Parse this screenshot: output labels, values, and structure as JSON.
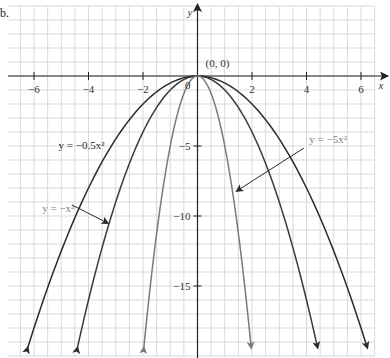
{
  "figure": {
    "part_label": "b."
  },
  "chart_data": {
    "type": "line",
    "title": "",
    "xlabel": "x",
    "ylabel": "y",
    "xlim": [
      -6.95,
      6.4
    ],
    "ylim": [
      -20,
      5
    ],
    "grid": true,
    "grid_x_step": 0.5,
    "grid_y_step": 1,
    "x_ticks": [
      -6,
      -4,
      -2,
      2,
      4,
      6
    ],
    "x_tick_labels": [
      "−6",
      "−4",
      "−2",
      "2",
      "4",
      "6"
    ],
    "y_ticks": [
      -5,
      -10,
      -15
    ],
    "y_tick_labels": [
      "−5",
      "−10",
      "−15"
    ],
    "origin_label": "0",
    "series": [
      {
        "name": "y = −0.5x²",
        "coefficient": -0.5,
        "color": "#2a2a2a",
        "label_color": "#2a2a2a"
      },
      {
        "name": "y = −x²",
        "coefficient": -1,
        "color": "#3a3a3a",
        "label_color": "#808080"
      },
      {
        "name": "y = −5x²",
        "coefficient": -5,
        "color": "#7a7a7a",
        "label_color": "#808080"
      }
    ],
    "annotations": [
      {
        "text": "(0, 0)",
        "x": 0,
        "y": 0
      },
      {
        "text": "y = −0.5x²",
        "x": -5.1,
        "y": -5.2
      },
      {
        "text": "y = −x²",
        "x": -5.7,
        "y": -9.7,
        "arrow_to": [
          -3.3,
          -10.5
        ]
      },
      {
        "text": "y = −5x²",
        "x": 4.1,
        "y": -4.8,
        "arrow_to": [
          1.45,
          -8.2
        ]
      }
    ],
    "axis_color": "#222222",
    "grid_color": "#d9d9d9"
  }
}
